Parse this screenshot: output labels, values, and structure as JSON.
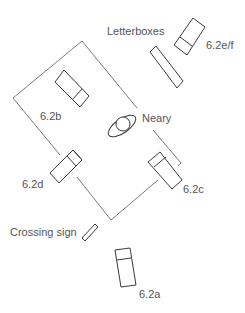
{
  "diagram": {
    "labels": {
      "letterboxes": "Letterboxes",
      "e_f": "6.2e/f",
      "b": "6.2b",
      "neary": "Neary",
      "d": "6.2d",
      "c": "6.2c",
      "crossing_sign": "Crossing sign",
      "a": "6.2a"
    },
    "colors": {
      "line": "#6a6a6a",
      "shape": "#3a3a3a",
      "text": "#555555",
      "background": "#ffffff"
    }
  }
}
